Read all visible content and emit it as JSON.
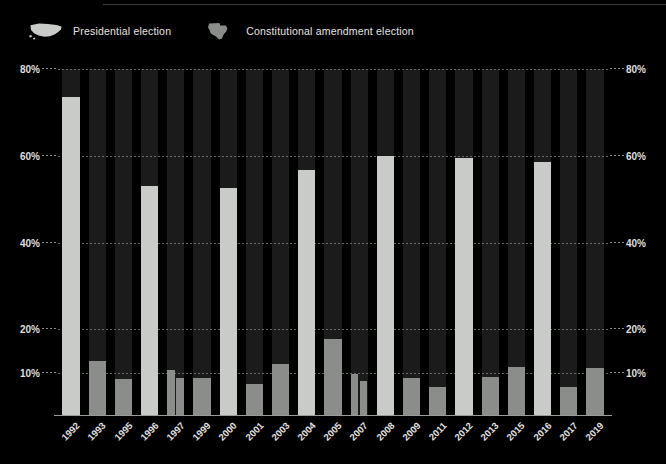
{
  "legend": {
    "items": [
      {
        "label": "Presidential election",
        "icon": "us-map-icon",
        "color": "#c9cbc9"
      },
      {
        "label": "Constitutional amendment election",
        "icon": "texas-map-icon",
        "color": "#8b8d8b"
      }
    ]
  },
  "chart_data": {
    "type": "bar",
    "title": "",
    "subtitle": "",
    "xlabel": "",
    "ylabel": "",
    "ylim": [
      0,
      80
    ],
    "grid": true,
    "legend_position": "top-left",
    "y_ticks": [
      "10%",
      "20%",
      "40%",
      "60%",
      "80%"
    ],
    "y_tick_values": [
      10,
      20,
      40,
      60,
      80
    ],
    "y_axis_mirrored": true,
    "categories": [
      "1992",
      "1993",
      "1995",
      "1996",
      "1997",
      "1999",
      "2000",
      "2001",
      "2003",
      "2004",
      "2005",
      "2007",
      "2008",
      "2009",
      "2011",
      "2012",
      "2013",
      "2015",
      "2016",
      "2017",
      "2019"
    ],
    "series": [
      {
        "name": "Presidential election",
        "color": "#c9cbc9",
        "values": [
          73.5,
          null,
          null,
          53.0,
          null,
          null,
          52.5,
          null,
          null,
          56.8,
          null,
          null,
          59.9,
          null,
          null,
          59.5,
          null,
          null,
          58.6,
          null,
          null
        ]
      },
      {
        "name": "Constitutional amendment election",
        "color": "#8b8d8b",
        "values": [
          null,
          12.6,
          8.6,
          null,
          10.5,
          8.7,
          null,
          7.4,
          12.0,
          null,
          17.7,
          9.6,
          null,
          8.8,
          6.6,
          null,
          8.9,
          11.4,
          null,
          6.6,
          11.0
        ]
      }
    ],
    "extra_bars": [
      {
        "category": "1997",
        "series": "Constitutional amendment election",
        "value": 8.8,
        "note": "second 1997 election"
      },
      {
        "category": "2007",
        "series": "Constitutional amendment election",
        "value": 8.1,
        "note": "second 2007 election"
      }
    ]
  }
}
